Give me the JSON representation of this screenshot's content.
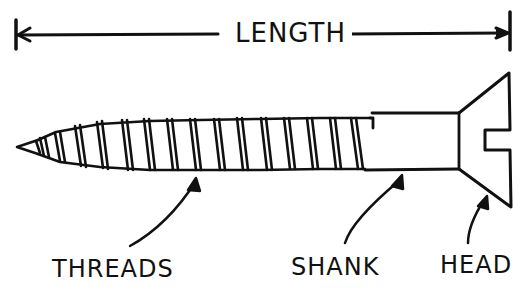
{
  "diagram": {
    "dimension": {
      "label": "LENGTH"
    },
    "parts": [
      {
        "id": "threads",
        "label": "THREADS"
      },
      {
        "id": "shank",
        "label": "SHANK"
      },
      {
        "id": "head",
        "label": "HEAD"
      }
    ],
    "colors": {
      "ink": "#111111",
      "background": "#ffffff"
    }
  }
}
